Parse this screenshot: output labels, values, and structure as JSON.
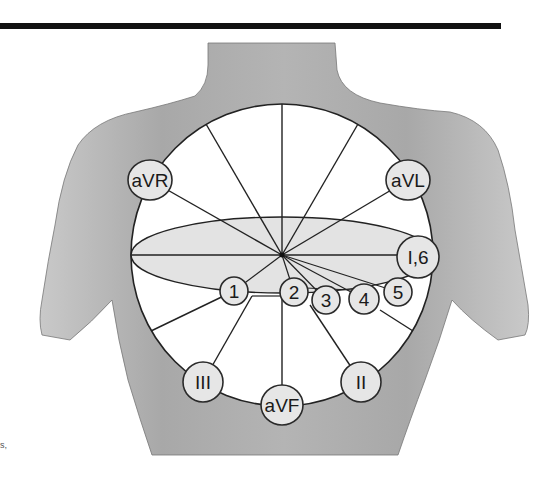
{
  "figure": {
    "type": "hexaxial and precordial ECG lead reference diagram on torso",
    "colors": {
      "background": "#ffffff",
      "torso": "#b8b8b8",
      "circle_fill": "#ffffff",
      "ellipse_fill": "#e3e3e3",
      "lead_circle_fill": "#e6e6e6",
      "line": "#222222",
      "top_rule": "#111111"
    }
  },
  "limb_leads": [
    {
      "label": "aVR",
      "cx": 150,
      "cy": 180
    },
    {
      "label": "aVL",
      "cx": 408,
      "cy": 180
    },
    {
      "label": "I,6",
      "cx": 418,
      "cy": 255
    },
    {
      "label": "III",
      "cx": 203,
      "cy": 382
    },
    {
      "label": "aVF",
      "cx": 282,
      "cy": 405
    },
    {
      "label": "II",
      "cx": 361,
      "cy": 382
    }
  ],
  "precordial_leads": [
    {
      "label": "1",
      "cx": 234,
      "cy": 291
    },
    {
      "label": "2",
      "cx": 294,
      "cy": 292
    },
    {
      "label": "3",
      "cx": 326,
      "cy": 300
    },
    {
      "label": "4",
      "cx": 364,
      "cy": 299
    },
    {
      "label": "5",
      "cx": 398,
      "cy": 292
    }
  ],
  "margin_text": "s,"
}
